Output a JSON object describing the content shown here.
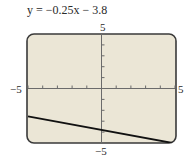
{
  "chart_data": {
    "type": "line",
    "title": "y = −0.25x − 3.8",
    "equation": {
      "slope": -0.25,
      "intercept": -3.8
    },
    "xlabel": "",
    "ylabel": "",
    "xlim": [
      -5,
      5
    ],
    "ylim": [
      -5,
      5
    ],
    "x_tick_step": 1,
    "y_tick_step": 1,
    "axis_labels": {
      "xmin": "−5",
      "xmax": "5",
      "ymin": "−5",
      "ymax": "5"
    },
    "grid": false,
    "legend": null,
    "series": [
      {
        "name": "y = −0.25x − 3.8",
        "x": [
          -5,
          5
        ],
        "y": [
          -2.55,
          -5.05
        ]
      }
    ]
  },
  "style": {
    "screen_bg": "#ebe6d6",
    "frame_color": "#3a3a3a",
    "axis_color": "#6b6b6b",
    "line_color": "#111111"
  }
}
